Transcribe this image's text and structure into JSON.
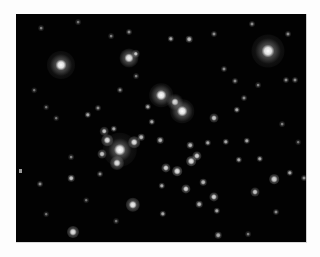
{
  "image": {
    "subject": "star cluster",
    "background": "#020202",
    "frame": {
      "left": 16,
      "top": 14,
      "width": 290,
      "height": 228
    }
  },
  "stars": [
    {
      "x": 45,
      "y": 51,
      "r": 3,
      "glow": 11,
      "b": 1.0
    },
    {
      "x": 113,
      "y": 44,
      "r": 2.5,
      "glow": 7,
      "b": 0.95
    },
    {
      "x": 120,
      "y": 40,
      "r": 1.2,
      "glow": 3,
      "b": 0.8
    },
    {
      "x": 252,
      "y": 37,
      "r": 3.5,
      "glow": 13,
      "b": 1.0
    },
    {
      "x": 145,
      "y": 81,
      "r": 2.8,
      "glow": 9,
      "b": 1.0
    },
    {
      "x": 159,
      "y": 88,
      "r": 2,
      "glow": 6,
      "b": 0.9
    },
    {
      "x": 166,
      "y": 97,
      "r": 2.8,
      "glow": 9,
      "b": 1.0
    },
    {
      "x": 104,
      "y": 136,
      "r": 3.2,
      "glow": 14,
      "b": 1.0
    },
    {
      "x": 91,
      "y": 126,
      "r": 1.8,
      "glow": 4,
      "b": 0.9
    },
    {
      "x": 118,
      "y": 128,
      "r": 1.8,
      "glow": 4,
      "b": 0.9
    },
    {
      "x": 101,
      "y": 149,
      "r": 2,
      "glow": 5,
      "b": 0.9
    },
    {
      "x": 86,
      "y": 140,
      "r": 1.5,
      "glow": 3,
      "b": 0.8
    },
    {
      "x": 88,
      "y": 117,
      "r": 1.3,
      "glow": 3,
      "b": 0.8
    },
    {
      "x": 117,
      "y": 191,
      "r": 2.2,
      "glow": 5,
      "b": 0.95
    },
    {
      "x": 57,
      "y": 218,
      "r": 2,
      "glow": 4,
      "b": 0.9
    },
    {
      "x": 55,
      "y": 164,
      "r": 1.3,
      "glow": 2,
      "b": 0.8
    },
    {
      "x": 72,
      "y": 101,
      "r": 1.2,
      "glow": 2,
      "b": 0.7
    },
    {
      "x": 82,
      "y": 94,
      "r": 1,
      "glow": 2,
      "b": 0.6
    },
    {
      "x": 98,
      "y": 115,
      "r": 1.2,
      "glow": 2,
      "b": 0.7
    },
    {
      "x": 136,
      "y": 108,
      "r": 1.2,
      "glow": 2,
      "b": 0.7
    },
    {
      "x": 144,
      "y": 126,
      "r": 1.3,
      "glow": 2,
      "b": 0.75
    },
    {
      "x": 174,
      "y": 131,
      "r": 1.3,
      "glow": 2,
      "b": 0.75
    },
    {
      "x": 181,
      "y": 142,
      "r": 1.6,
      "glow": 3,
      "b": 0.85
    },
    {
      "x": 192,
      "y": 129,
      "r": 1.2,
      "glow": 2,
      "b": 0.7
    },
    {
      "x": 198,
      "y": 104,
      "r": 1.5,
      "glow": 3,
      "b": 0.8
    },
    {
      "x": 210,
      "y": 128,
      "r": 1.2,
      "glow": 2,
      "b": 0.7
    },
    {
      "x": 231,
      "y": 127,
      "r": 1.2,
      "glow": 2,
      "b": 0.7
    },
    {
      "x": 244,
      "y": 145,
      "r": 1.2,
      "glow": 2,
      "b": 0.7
    },
    {
      "x": 258,
      "y": 165,
      "r": 1.8,
      "glow": 3,
      "b": 0.85
    },
    {
      "x": 239,
      "y": 178,
      "r": 1.5,
      "glow": 3,
      "b": 0.8
    },
    {
      "x": 198,
      "y": 183,
      "r": 1.6,
      "glow": 3,
      "b": 0.85
    },
    {
      "x": 183,
      "y": 190,
      "r": 1.3,
      "glow": 2,
      "b": 0.75
    },
    {
      "x": 170,
      "y": 175,
      "r": 1.6,
      "glow": 3,
      "b": 0.85
    },
    {
      "x": 150,
      "y": 154,
      "r": 1.6,
      "glow": 3,
      "b": 0.85
    },
    {
      "x": 146,
      "y": 172,
      "r": 1.2,
      "glow": 2,
      "b": 0.7
    },
    {
      "x": 161,
      "y": 157,
      "r": 1.8,
      "glow": 3,
      "b": 0.9
    },
    {
      "x": 175,
      "y": 147,
      "r": 1.8,
      "glow": 3,
      "b": 0.9
    },
    {
      "x": 223,
      "y": 146,
      "r": 1.2,
      "glow": 2,
      "b": 0.7
    },
    {
      "x": 274,
      "y": 159,
      "r": 1.2,
      "glow": 2,
      "b": 0.7
    },
    {
      "x": 288,
      "y": 164,
      "r": 1,
      "glow": 2,
      "b": 0.6
    },
    {
      "x": 187,
      "y": 168,
      "r": 1.3,
      "glow": 2,
      "b": 0.75
    },
    {
      "x": 201,
      "y": 197,
      "r": 1.2,
      "glow": 2,
      "b": 0.7
    },
    {
      "x": 147,
      "y": 200,
      "r": 1.2,
      "glow": 2,
      "b": 0.7
    },
    {
      "x": 202,
      "y": 221,
      "r": 1.3,
      "glow": 2,
      "b": 0.7
    },
    {
      "x": 24,
      "y": 170,
      "r": 1,
      "glow": 2,
      "b": 0.6
    },
    {
      "x": 84,
      "y": 160,
      "r": 1,
      "glow": 2,
      "b": 0.6
    },
    {
      "x": 55,
      "y": 143,
      "r": 0.9,
      "glow": 2,
      "b": 0.55
    },
    {
      "x": 155,
      "y": 25,
      "r": 1.2,
      "glow": 2,
      "b": 0.7
    },
    {
      "x": 173,
      "y": 25,
      "r": 1.3,
      "glow": 2,
      "b": 0.75
    },
    {
      "x": 198,
      "y": 20,
      "r": 1,
      "glow": 2,
      "b": 0.6
    },
    {
      "x": 236,
      "y": 10,
      "r": 1,
      "glow": 2,
      "b": 0.6
    },
    {
      "x": 113,
      "y": 18,
      "r": 1,
      "glow": 2,
      "b": 0.6
    },
    {
      "x": 95,
      "y": 22,
      "r": 0.9,
      "glow": 2,
      "b": 0.55
    },
    {
      "x": 25,
      "y": 14,
      "r": 0.9,
      "glow": 2,
      "b": 0.55
    },
    {
      "x": 62,
      "y": 8,
      "r": 0.9,
      "glow": 2,
      "b": 0.5
    },
    {
      "x": 272,
      "y": 20,
      "r": 1,
      "glow": 2,
      "b": 0.6
    },
    {
      "x": 208,
      "y": 55,
      "r": 1,
      "glow": 2,
      "b": 0.6
    },
    {
      "x": 219,
      "y": 67,
      "r": 1,
      "glow": 2,
      "b": 0.6
    },
    {
      "x": 242,
      "y": 71,
      "r": 0.9,
      "glow": 2,
      "b": 0.55
    },
    {
      "x": 270,
      "y": 66,
      "r": 1,
      "glow": 2,
      "b": 0.6
    },
    {
      "x": 279,
      "y": 66,
      "r": 1,
      "glow": 2,
      "b": 0.6
    },
    {
      "x": 221,
      "y": 96,
      "r": 1.2,
      "glow": 2,
      "b": 0.7
    },
    {
      "x": 228,
      "y": 84,
      "r": 1,
      "glow": 2,
      "b": 0.6
    },
    {
      "x": 120,
      "y": 62,
      "r": 0.9,
      "glow": 2,
      "b": 0.55
    },
    {
      "x": 104,
      "y": 76,
      "r": 1,
      "glow": 2,
      "b": 0.6
    },
    {
      "x": 18,
      "y": 76,
      "r": 0.8,
      "glow": 2,
      "b": 0.5
    },
    {
      "x": 30,
      "y": 93,
      "r": 0.8,
      "glow": 2,
      "b": 0.5
    },
    {
      "x": 40,
      "y": 104,
      "r": 0.8,
      "glow": 2,
      "b": 0.5
    },
    {
      "x": 132,
      "y": 93,
      "r": 1.2,
      "glow": 2,
      "b": 0.7
    },
    {
      "x": 125,
      "y": 123,
      "r": 1.3,
      "glow": 2,
      "b": 0.75
    },
    {
      "x": 260,
      "y": 198,
      "r": 1,
      "glow": 2,
      "b": 0.6
    },
    {
      "x": 232,
      "y": 220,
      "r": 0.9,
      "glow": 2,
      "b": 0.55
    },
    {
      "x": 100,
      "y": 207,
      "r": 0.9,
      "glow": 2,
      "b": 0.5
    },
    {
      "x": 30,
      "y": 200,
      "r": 0.8,
      "glow": 2,
      "b": 0.5
    },
    {
      "x": 70,
      "y": 186,
      "r": 0.8,
      "glow": 2,
      "b": 0.5
    },
    {
      "x": 266,
      "y": 110,
      "r": 0.9,
      "glow": 2,
      "b": 0.55
    },
    {
      "x": 282,
      "y": 128,
      "r": 0.8,
      "glow": 2,
      "b": 0.5
    }
  ]
}
